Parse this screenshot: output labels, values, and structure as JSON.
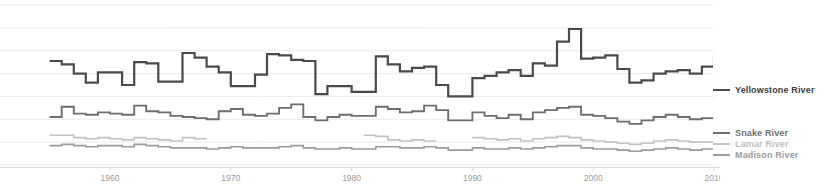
{
  "chart_data": {
    "type": "line",
    "title": "",
    "subtitle": "",
    "xlabel": "",
    "ylabel": "",
    "step": true,
    "grid": true,
    "legend_position": "right",
    "xlim": [
      1955,
      2012
    ],
    "xticks": [
      1960,
      1970,
      1980,
      1990,
      2000,
      2010
    ],
    "xtick_labels": [
      "1960",
      "1970",
      "1980",
      "1990",
      "2000",
      "2010"
    ],
    "ylim": [
      0,
      14
    ],
    "ygridlines": [
      0,
      2,
      4,
      6,
      8,
      10,
      12,
      14
    ],
    "series": [
      {
        "name": "Yellowstone River",
        "color": "#4a4a4a",
        "x": [
          1955,
          1956,
          1957,
          1958,
          1959,
          1960,
          1961,
          1962,
          1963,
          1964,
          1965,
          1966,
          1967,
          1968,
          1969,
          1970,
          1971,
          1972,
          1973,
          1974,
          1975,
          1976,
          1977,
          1978,
          1979,
          1980,
          1981,
          1982,
          1983,
          1984,
          1985,
          1986,
          1987,
          1988,
          1989,
          1990,
          1991,
          1992,
          1993,
          1994,
          1995,
          1996,
          1997,
          1998,
          1999,
          2000,
          2001,
          2002,
          2003,
          2004,
          2005,
          2006,
          2007,
          2008,
          2009,
          2010,
          2011,
          2012
        ],
        "values": [
          9.1,
          8.8,
          8.0,
          7.2,
          8.1,
          8.1,
          7.0,
          9.0,
          8.9,
          7.3,
          7.3,
          9.8,
          9.4,
          8.6,
          8.1,
          6.9,
          6.9,
          7.9,
          9.7,
          9.6,
          9.2,
          9.1,
          6.2,
          6.9,
          6.9,
          6.4,
          6.4,
          9.5,
          8.8,
          8.2,
          8.5,
          8.6,
          7.0,
          6.0,
          6.0,
          7.6,
          7.8,
          8.1,
          8.3,
          7.8,
          8.9,
          8.7,
          10.8,
          11.9,
          9.3,
          9.4,
          9.6,
          8.4,
          7.2,
          7.4,
          8.0,
          8.2,
          8.3,
          8.0,
          8.6,
          9.5,
          9.5,
          8.3
        ]
      },
      {
        "name": "Snake River",
        "color": "#6e6e6e",
        "x": [
          1955,
          1956,
          1957,
          1958,
          1959,
          1960,
          1961,
          1962,
          1963,
          1964,
          1965,
          1966,
          1967,
          1968,
          1969,
          1970,
          1971,
          1972,
          1973,
          1974,
          1975,
          1976,
          1977,
          1978,
          1979,
          1980,
          1981,
          1982,
          1983,
          1984,
          1985,
          1986,
          1987,
          1988,
          1989,
          1990,
          1991,
          1992,
          1993,
          1994,
          1995,
          1996,
          1997,
          1998,
          1999,
          2000,
          2001,
          2002,
          2003,
          2004,
          2005,
          2006,
          2007,
          2008,
          2009,
          2010,
          2011,
          2012
        ],
        "values": [
          4.2,
          5.1,
          4.5,
          4.4,
          4.6,
          4.5,
          4.4,
          5.2,
          4.7,
          4.6,
          4.3,
          4.2,
          4.1,
          4.0,
          4.7,
          4.9,
          4.4,
          4.3,
          4.5,
          5.0,
          5.3,
          4.2,
          3.9,
          4.2,
          4.4,
          4.3,
          4.3,
          5.1,
          4.9,
          4.6,
          4.7,
          5.2,
          4.8,
          3.9,
          3.9,
          4.6,
          4.3,
          4.1,
          4.4,
          4.0,
          4.6,
          4.8,
          5.0,
          5.1,
          4.4,
          4.3,
          4.1,
          3.8,
          3.6,
          3.9,
          4.2,
          4.4,
          4.2,
          4.0,
          4.1,
          4.3,
          4.2,
          3.9
        ]
      },
      {
        "name": "Lamar River",
        "color": "#c2c2c2",
        "x": [
          1955,
          1956,
          1957,
          1958,
          1959,
          1960,
          1961,
          1962,
          1963,
          1964,
          1965,
          1966,
          1967,
          1968,
          1969,
          1970,
          1971,
          1972,
          1973,
          1974,
          1975,
          1976,
          1977,
          1978,
          1979,
          1980,
          1981,
          1982,
          1983,
          1984,
          1985,
          1986,
          1987,
          1988,
          1989,
          1990,
          1991,
          1992,
          1993,
          1994,
          1995,
          1996,
          1997,
          1998,
          1999,
          2000,
          2001,
          2002,
          2003,
          2004,
          2005,
          2006,
          2007,
          2008,
          2009,
          2010,
          2011,
          2012
        ],
        "values": [
          2.6,
          2.6,
          2.4,
          2.3,
          2.4,
          2.3,
          2.2,
          2.4,
          2.3,
          2.2,
          2.1,
          2.4,
          2.3,
          null,
          null,
          null,
          null,
          null,
          null,
          null,
          null,
          null,
          null,
          null,
          null,
          null,
          2.6,
          2.5,
          2.2,
          2.1,
          2.2,
          2.1,
          null,
          null,
          null,
          2.4,
          2.3,
          2.2,
          2.3,
          2.1,
          2.3,
          2.4,
          2.5,
          2.4,
          2.2,
          2.1,
          2.0,
          1.9,
          1.8,
          1.9,
          2.1,
          2.2,
          2.1,
          2.0,
          2.0,
          2.1,
          2.1,
          1.9
        ]
      },
      {
        "name": "Madison River",
        "color": "#9b9b9b",
        "x": [
          1955,
          1956,
          1957,
          1958,
          1959,
          1960,
          1961,
          1962,
          1963,
          1964,
          1965,
          1966,
          1967,
          1968,
          1969,
          1970,
          1971,
          1972,
          1973,
          1974,
          1975,
          1976,
          1977,
          1978,
          1979,
          1980,
          1981,
          1982,
          1983,
          1984,
          1985,
          1986,
          1987,
          1988,
          1989,
          1990,
          1991,
          1992,
          1993,
          1994,
          1995,
          1996,
          1997,
          1998,
          1999,
          2000,
          2001,
          2002,
          2003,
          2004,
          2005,
          2006,
          2007,
          2008,
          2009,
          2010,
          2011,
          2012
        ],
        "values": [
          1.7,
          1.8,
          1.7,
          1.6,
          1.7,
          1.7,
          1.6,
          1.8,
          1.7,
          1.6,
          1.5,
          1.5,
          1.5,
          1.4,
          1.5,
          1.6,
          1.5,
          1.5,
          1.5,
          1.6,
          1.7,
          1.5,
          1.4,
          1.4,
          1.5,
          1.4,
          1.4,
          1.6,
          1.6,
          1.5,
          1.5,
          1.6,
          1.5,
          1.3,
          1.3,
          1.5,
          1.4,
          1.4,
          1.5,
          1.4,
          1.5,
          1.6,
          1.7,
          1.7,
          1.5,
          1.4,
          1.4,
          1.3,
          1.2,
          1.3,
          1.4,
          1.5,
          1.4,
          1.3,
          1.4,
          1.5,
          1.4,
          1.3
        ]
      }
    ]
  },
  "legend": {
    "items": [
      {
        "label": "Yellowstone River",
        "color": "#4a4a4a"
      },
      {
        "label": "Snake River",
        "color": "#6e6e6e"
      },
      {
        "label": "Lamar River",
        "color": "#c2c2c2"
      },
      {
        "label": "Madison River",
        "color": "#9b9b9b"
      }
    ]
  },
  "axis": {
    "tick_labels": [
      "1960",
      "1970",
      "1980",
      "1990",
      "2000",
      "2010"
    ]
  },
  "colors": {
    "gridline": "#ebebeb",
    "axisline": "#d8d8d8",
    "background": "#ffffff"
  }
}
